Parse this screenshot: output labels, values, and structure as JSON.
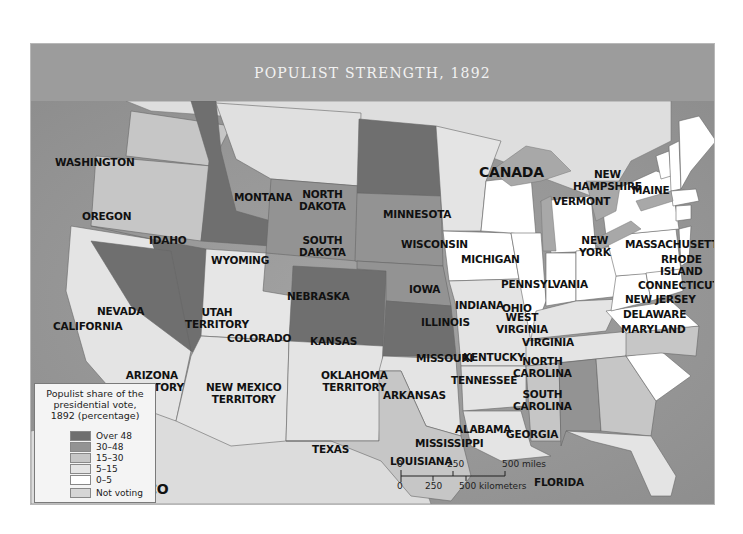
{
  "title": "POPULIST STRENGTH, 1892",
  "colors": {
    "over48": "#6f6f6f",
    "r30_48": "#939393",
    "r15_30": "#c6c6c6",
    "r5_15": "#e4e4e4",
    "r0_5": "#ffffff",
    "not_voting": "#d6d6d6",
    "water": "#9b9b9b",
    "lakes": "#a8a8a8",
    "foreign_land": "#dcdcdc"
  },
  "legend": {
    "title": "Populist share of the presidential vote, 1892 (percentage)",
    "items": [
      {
        "label": "Over 48",
        "color": "#6f6f6f"
      },
      {
        "label": "30–48",
        "color": "#939393"
      },
      {
        "label": "15–30",
        "color": "#c6c6c6"
      },
      {
        "label": "5–15",
        "color": "#e4e4e4"
      },
      {
        "label": "0–5",
        "color": "#ffffff"
      },
      {
        "label": "Not voting",
        "color": "#d6d6d6"
      }
    ]
  },
  "scale": {
    "miles": [
      "0",
      "250",
      "500 miles"
    ],
    "km": [
      "0",
      "250",
      "500 kilometers"
    ]
  },
  "regions": {
    "canada": "CANADA",
    "mexico": "MEXICO"
  },
  "states": [
    {
      "name": "WASHINGTON",
      "category": "15–30"
    },
    {
      "name": "OREGON",
      "category": "15–30"
    },
    {
      "name": "CALIFORNIA",
      "category": "5–15"
    },
    {
      "name": "IDAHO",
      "category": "Over 48"
    },
    {
      "name": "NEVADA",
      "category": "Over 48"
    },
    {
      "name": "MONTANA",
      "category": "15–30"
    },
    {
      "name": "WYOMING",
      "category": "30–48"
    },
    {
      "name": "UTAH TERRITORY",
      "category": "Not voting"
    },
    {
      "name": "COLORADO",
      "category": "Over 48"
    },
    {
      "name": "ARIZONA TERRITORY",
      "category": "Not voting"
    },
    {
      "name": "NEW MEXICO TERRITORY",
      "category": "Not voting"
    },
    {
      "name": "NORTH DAKOTA",
      "category": "Over 48"
    },
    {
      "name": "SOUTH DAKOTA",
      "category": "30–48"
    },
    {
      "name": "NEBRASKA",
      "category": "30–48"
    },
    {
      "name": "KANSAS",
      "category": "Over 48"
    },
    {
      "name": "OKLAHOMA TERRITORY",
      "category": "Not voting"
    },
    {
      "name": "TEXAS",
      "category": "15–30"
    },
    {
      "name": "MINNESOTA",
      "category": "5–15"
    },
    {
      "name": "IOWA",
      "category": "0–5"
    },
    {
      "name": "MISSOURI",
      "category": "5–15"
    },
    {
      "name": "ARKANSAS",
      "category": "5–15"
    },
    {
      "name": "LOUISIANA",
      "category": "5–15"
    },
    {
      "name": "WISCONSIN",
      "category": "0–5"
    },
    {
      "name": "ILLINOIS",
      "category": "0–5"
    },
    {
      "name": "MICHIGAN",
      "category": "0–5"
    },
    {
      "name": "INDIANA",
      "category": "0–5"
    },
    {
      "name": "OHIO",
      "category": "0–5"
    },
    {
      "name": "KENTUCKY",
      "category": "5–15"
    },
    {
      "name": "TENNESSEE",
      "category": "5–15"
    },
    {
      "name": "MISSISSIPPI",
      "category": "15–30"
    },
    {
      "name": "ALABAMA",
      "category": "30–48"
    },
    {
      "name": "GEORGIA",
      "category": "15–30"
    },
    {
      "name": "FLORIDA",
      "category": "5–15"
    },
    {
      "name": "SOUTH CAROLINA",
      "category": "0–5"
    },
    {
      "name": "NORTH CAROLINA",
      "category": "15–30"
    },
    {
      "name": "VIRGINIA",
      "category": "0–5"
    },
    {
      "name": "WEST VIRGINIA",
      "category": "0–5"
    },
    {
      "name": "PENNSYLVANIA",
      "category": "0–5"
    },
    {
      "name": "NEW YORK",
      "category": "0–5"
    },
    {
      "name": "VERMONT",
      "category": "0–5"
    },
    {
      "name": "NEW HAMPSHIRE",
      "category": "0–5"
    },
    {
      "name": "MAINE",
      "category": "0–5"
    },
    {
      "name": "MASSACHUSETTS",
      "category": "0–5"
    },
    {
      "name": "RHODE ISLAND",
      "category": "0–5"
    },
    {
      "name": "CONNECTICUT",
      "category": "0–5"
    },
    {
      "name": "NEW JERSEY",
      "category": "0–5"
    },
    {
      "name": "DELAWARE",
      "category": "0–5"
    },
    {
      "name": "MARYLAND",
      "category": "0–5"
    }
  ],
  "labels": {
    "washington": "WASHINGTON",
    "oregon": "OREGON",
    "california": "CALIFORNIA",
    "idaho": "IDAHO",
    "nevada": "NEVADA",
    "montana": "MONTANA",
    "wyoming": "WYOMING",
    "utah1": "UTAH",
    "utah2": "TERRITORY",
    "colorado": "COLORADO",
    "arizona1": "ARIZONA",
    "arizona2": "TERRITORY",
    "newmexico1": "NEW MEXICO",
    "newmexico2": "TERRITORY",
    "nd1": "NORTH",
    "nd2": "DAKOTA",
    "sd1": "SOUTH",
    "sd2": "DAKOTA",
    "nebraska": "NEBRASKA",
    "kansas": "KANSAS",
    "oklahoma1": "OKLAHOMA",
    "oklahoma2": "TERRITORY",
    "texas": "TEXAS",
    "minnesota": "MINNESOTA",
    "iowa": "IOWA",
    "missouri": "MISSOURI",
    "arkansas": "ARKANSAS",
    "louisiana": "LOUISIANA",
    "wisconsin": "WISCONSIN",
    "illinois": "ILLINOIS",
    "michigan": "MICHIGAN",
    "indiana": "INDIANA",
    "ohio": "OHIO",
    "kentucky": "KENTUCKY",
    "tennessee": "TENNESSEE",
    "mississippi": "MISSISSIPPI",
    "alabama": "ALABAMA",
    "georgia": "GEORGIA",
    "florida": "FLORIDA",
    "sc1": "SOUTH",
    "sc2": "CAROLINA",
    "nc1": "NORTH",
    "nc2": "CAROLINA",
    "virginia": "VIRGINIA",
    "wv1": "WEST",
    "wv2": "VIRGINIA",
    "pennsylvania": "PENNSYLVANIA",
    "ny1": "NEW",
    "ny2": "YORK",
    "vermont": "VERMONT",
    "nh1": "NEW",
    "nh2": "HAMPSHIRE",
    "maine": "MAINE",
    "massachusetts": "MASSACHUSETTS",
    "ri1": "RHODE",
    "ri2": "ISLAND",
    "connecticut": "CONNECTICUT",
    "newjersey": "NEW JERSEY",
    "delaware": "DELAWARE",
    "maryland": "MARYLAND"
  }
}
